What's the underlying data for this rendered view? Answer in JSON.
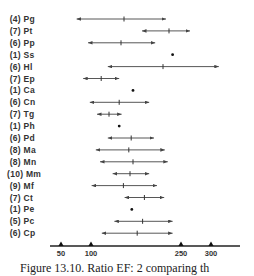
{
  "chart_data": {
    "type": "range-plot",
    "title": "",
    "caption": "Figure 13.10. Ratio EF: 2 comparing th",
    "xlabel": "",
    "ylabel": "",
    "xlim": [
      35,
      330
    ],
    "x_ticks": [
      50,
      100,
      250,
      300
    ],
    "grid": false,
    "legend": null,
    "rows": [
      {
        "n": 4,
        "label": "Pg",
        "min": 76,
        "mean": 155,
        "max": 225
      },
      {
        "n": 7,
        "label": "Pt",
        "min": 185,
        "mean": 230,
        "max": 265
      },
      {
        "n": 6,
        "label": "Pp",
        "min": 95,
        "mean": 150,
        "max": 207
      },
      {
        "n": 1,
        "label": "Ss",
        "min": null,
        "mean": 236,
        "max": null
      },
      {
        "n": 6,
        "label": "Hl",
        "min": 128,
        "mean": 220,
        "max": 313
      },
      {
        "n": 7,
        "label": "Ep",
        "min": 87,
        "mean": 117,
        "max": 147
      },
      {
        "n": 1,
        "label": "Ca",
        "min": null,
        "mean": 170,
        "max": null
      },
      {
        "n": 6,
        "label": "Cn",
        "min": 98,
        "mean": 147,
        "max": 197
      },
      {
        "n": 7,
        "label": "Tg",
        "min": 110,
        "mean": 130,
        "max": 151
      },
      {
        "n": 1,
        "label": "Ph",
        "min": null,
        "mean": 147,
        "max": null
      },
      {
        "n": 6,
        "label": "Pd",
        "min": 128,
        "mean": 167,
        "max": 205
      },
      {
        "n": 8,
        "label": "Ma",
        "min": 108,
        "mean": 163,
        "max": 223
      },
      {
        "n": 8,
        "label": "Mn",
        "min": 115,
        "mean": 170,
        "max": 228
      },
      {
        "n": 10,
        "label": "Mm",
        "min": 136,
        "mean": 165,
        "max": 197
      },
      {
        "n": 9,
        "label": "Mf",
        "min": 101,
        "mean": 154,
        "max": 210
      },
      {
        "n": 7,
        "label": "Ct",
        "min": 156,
        "mean": 189,
        "max": 222
      },
      {
        "n": 1,
        "label": "Pe",
        "min": null,
        "mean": 168,
        "max": null
      },
      {
        "n": 5,
        "label": "Pc",
        "min": 139,
        "mean": 186,
        "max": 236
      },
      {
        "n": 6,
        "label": "Cp",
        "min": 118,
        "mean": 177,
        "max": 236
      }
    ]
  },
  "layout": {
    "row_top_y": 19,
    "row_spacing": 11.9,
    "x_origin_px": 61,
    "x_origin_val": 50,
    "px_per_unit": 0.6,
    "axis_y": 246,
    "axis_x_start": 50,
    "axis_x_end": 240,
    "line_color": "#444444"
  }
}
